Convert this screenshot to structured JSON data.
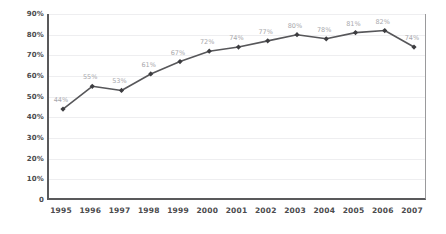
{
  "chart_data": {
    "type": "line",
    "title": "",
    "subtitle": "",
    "xlabel": "",
    "ylabel": "",
    "categories": [
      "1995",
      "1996",
      "1997",
      "1998",
      "1999",
      "2000",
      "2001",
      "2002",
      "2003",
      "2004",
      "2005",
      "2006",
      "2007"
    ],
    "values": [
      44,
      55,
      53,
      61,
      67,
      72,
      74,
      77,
      80,
      78,
      81,
      82,
      74
    ],
    "point_labels": [
      "44%",
      "55%",
      "53%",
      "61%",
      "67%",
      "72%",
      "74%",
      "77%",
      "80%",
      "78%",
      "81%",
      "82%",
      "74%"
    ],
    "ylim": [
      0,
      90
    ],
    "y_ticks": [
      90,
      80,
      70,
      60,
      50,
      40,
      30,
      20,
      10,
      0
    ],
    "y_tick_labels": [
      "90%",
      "80%",
      "70%",
      "60%",
      "50%",
      "40%",
      "30%",
      "20%",
      "10%",
      "0"
    ],
    "grid": true,
    "grid_axis": "y",
    "legend": false,
    "legend_position": "none",
    "marker": "diamond",
    "series_color": "#57575a",
    "marker_color": "#3d3d40",
    "label_color": "#a8a8ac",
    "axis_color": "#59595b",
    "grid_color": "#eeeef0",
    "background_color": "#ffffff"
  }
}
